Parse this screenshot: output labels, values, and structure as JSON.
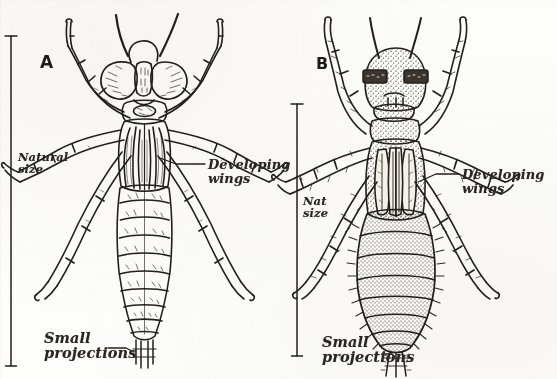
{
  "plate": {
    "kind": "scanned-figure-plate",
    "background_color": "#fdfdfb",
    "ink_color": "#241f1b",
    "width": 557,
    "height": 379
  },
  "figures": [
    {
      "letter": "A",
      "subject": "dragonfly-nymph",
      "letter_pos": {
        "x": 40,
        "y": 52
      },
      "scale_bar": {
        "x": 11,
        "y1": 36,
        "y2": 366,
        "cap": "serif-tee"
      },
      "labels": [
        {
          "name": "natural-size-label",
          "text": "Natural\nsize",
          "x": 18,
          "y": 152,
          "size": "sm"
        },
        {
          "name": "developing-wings-label",
          "text": "Developing\nwings",
          "x": 208,
          "y": 158,
          "size": "md"
        },
        {
          "name": "small-projections-label",
          "text": "Small\nprojections",
          "x": 44,
          "y": 330,
          "size": "lg"
        }
      ]
    },
    {
      "letter": "B",
      "subject": "mayfly-nymph",
      "letter_pos": {
        "x": 316,
        "y": 54
      },
      "scale_bar": {
        "x": 297,
        "y1": 104,
        "y2": 356,
        "cap": "serif-tee"
      },
      "labels": [
        {
          "name": "nat-size-label",
          "text": "Nat\nsize",
          "x": 303,
          "y": 196,
          "size": "sm"
        },
        {
          "name": "developing-wings-label",
          "text": "Developing\nwings",
          "x": 462,
          "y": 168,
          "size": "md"
        },
        {
          "name": "small-projections-label",
          "text": "Small\nprojections",
          "x": 322,
          "y": 334,
          "size": "lg"
        }
      ]
    }
  ]
}
